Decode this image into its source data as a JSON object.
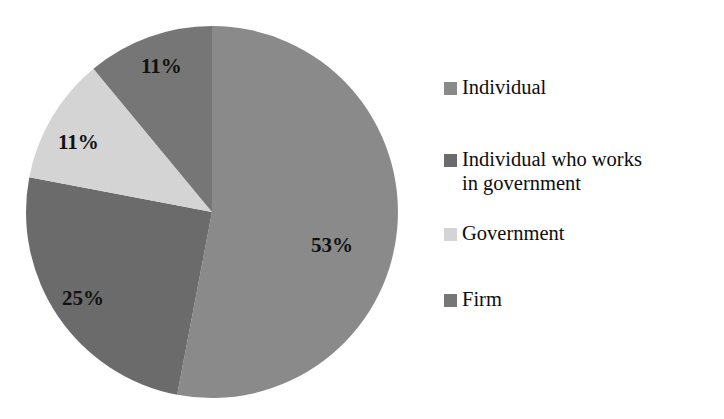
{
  "chart_data": {
    "type": "pie",
    "title": "",
    "subtitle": "",
    "xlabel": "",
    "ylabel": "",
    "grid": false,
    "legend_position": "right",
    "start_angle_deg": 0,
    "direction": "clockwise",
    "units": "percent",
    "categories": [
      "Individual",
      "Individual who works in government",
      "Government",
      "Firm"
    ],
    "values": [
      53,
      25,
      11,
      11
    ],
    "data_labels": [
      "53%",
      "25%",
      "11%",
      "11%"
    ],
    "colors": [
      "#8a8a8a",
      "#6b6b6b",
      "#d4d4d4",
      "#767676"
    ],
    "slices": [
      {
        "label": "Individual",
        "value": 53,
        "data_label": "53%",
        "color": "#8a8a8a",
        "start_deg": 0,
        "end_deg": 190.8
      },
      {
        "label": "Individual who works in government",
        "value": 25,
        "data_label": "25%",
        "color": "#6b6b6b",
        "start_deg": 190.8,
        "end_deg": 280.8
      },
      {
        "label": "Government",
        "value": 11,
        "data_label": "11%",
        "color": "#d4d4d4",
        "start_deg": 280.8,
        "end_deg": 320.4
      },
      {
        "label": "Firm",
        "value": 11,
        "data_label": "11%",
        "color": "#767676",
        "start_deg": 320.4,
        "end_deg": 360
      }
    ]
  },
  "legend": {
    "items": [
      {
        "label": "Individual",
        "color": "#8a8a8a"
      },
      {
        "label": "Individual who works\nin government",
        "color": "#6b6b6b"
      },
      {
        "label": "Government",
        "color": "#d4d4d4"
      },
      {
        "label": "Firm",
        "color": "#767676"
      }
    ]
  },
  "labels": {
    "individual_pct": "53%",
    "individual_gov_pct": "25%",
    "government_pct": "11%",
    "firm_pct": "11%"
  }
}
